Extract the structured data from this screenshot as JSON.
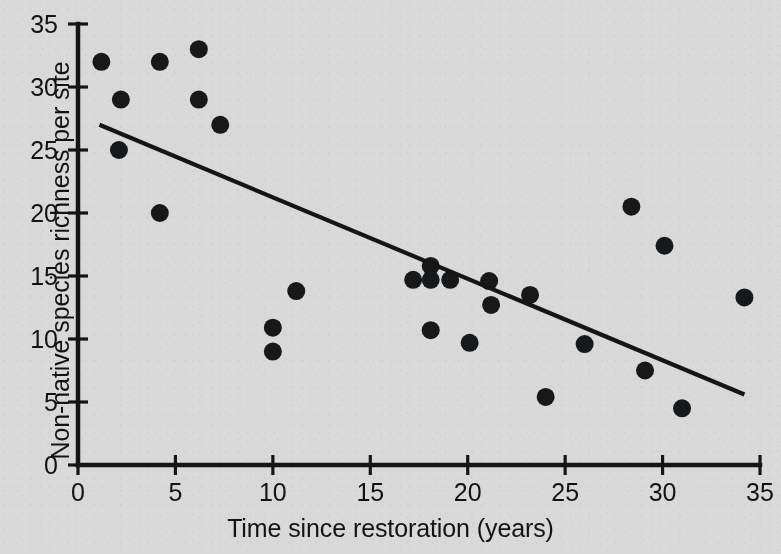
{
  "chart_data": {
    "type": "scatter",
    "title": "",
    "xlabel": "Time since restoration (years)",
    "ylabel": "Non-native species richness per site",
    "xlim": [
      0,
      35
    ],
    "ylim": [
      0,
      35
    ],
    "xticks": [
      0,
      5,
      10,
      15,
      20,
      25,
      30,
      35
    ],
    "yticks": [
      0,
      5,
      10,
      15,
      20,
      25,
      30,
      35
    ],
    "xticklabels": [
      "0",
      "5",
      "10",
      "15",
      "20",
      "25",
      "30",
      "35"
    ],
    "yticklabels": [
      "0",
      "5",
      "10",
      "15",
      "20",
      "25",
      "30",
      "35"
    ],
    "grid": false,
    "legend": null,
    "marker": "filled-circle",
    "marker_color": "#16181a",
    "marker_size_px": 9,
    "background_color": "#d9d9d9",
    "axis_color": "#151515",
    "points": [
      {
        "x": 1.2,
        "y": 32.0
      },
      {
        "x": 2.2,
        "y": 29.0
      },
      {
        "x": 2.1,
        "y": 25.0
      },
      {
        "x": 4.2,
        "y": 20.0
      },
      {
        "x": 4.2,
        "y": 32.0
      },
      {
        "x": 6.2,
        "y": 33.0
      },
      {
        "x": 6.2,
        "y": 29.0
      },
      {
        "x": 7.3,
        "y": 27.0
      },
      {
        "x": 10.0,
        "y": 10.9
      },
      {
        "x": 10.0,
        "y": 9.0
      },
      {
        "x": 11.2,
        "y": 13.8
      },
      {
        "x": 17.2,
        "y": 14.7
      },
      {
        "x": 18.1,
        "y": 15.8
      },
      {
        "x": 18.1,
        "y": 14.7
      },
      {
        "x": 18.1,
        "y": 10.7
      },
      {
        "x": 19.1,
        "y": 14.7
      },
      {
        "x": 20.1,
        "y": 9.7
      },
      {
        "x": 21.1,
        "y": 14.6
      },
      {
        "x": 21.2,
        "y": 12.7
      },
      {
        "x": 23.2,
        "y": 13.5
      },
      {
        "x": 24.0,
        "y": 5.4
      },
      {
        "x": 26.0,
        "y": 9.6
      },
      {
        "x": 28.4,
        "y": 20.5
      },
      {
        "x": 29.1,
        "y": 7.5
      },
      {
        "x": 30.1,
        "y": 17.4
      },
      {
        "x": 31.0,
        "y": 4.5
      },
      {
        "x": 34.2,
        "y": 13.3
      }
    ],
    "trendline": {
      "name": "linear fit",
      "x_start": 1.1,
      "y_start": 27.0,
      "x_end": 34.2,
      "y_end": 5.6,
      "slope": -0.646,
      "intercept": 27.71,
      "color": "#151515"
    }
  },
  "figure": {
    "width_px": 781,
    "height_px": 554
  }
}
